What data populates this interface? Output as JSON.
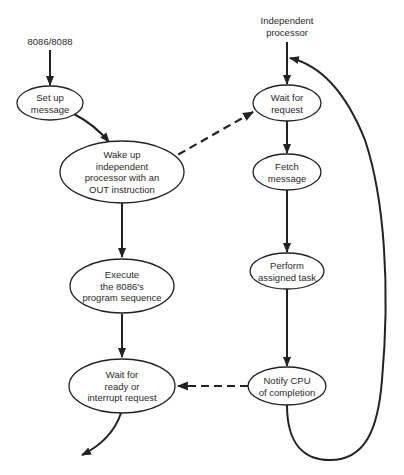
{
  "diagram": {
    "title_left": "8086/8088",
    "title_right": [
      "Independent",
      "processor"
    ],
    "cpu_nodes": [
      {
        "id": "setup",
        "lines": [
          "Set up",
          "message"
        ]
      },
      {
        "id": "wakeup",
        "lines": [
          "Wake up",
          "independent",
          "processor with an",
          "OUT instruction"
        ]
      },
      {
        "id": "execute",
        "lines": [
          "Execute",
          "the 8086's",
          "program sequence"
        ]
      },
      {
        "id": "waitready",
        "lines": [
          "Wait for",
          "ready or",
          "interrupt request"
        ]
      }
    ],
    "processor_nodes": [
      {
        "id": "waitrequest",
        "lines": [
          "Wait for",
          "request"
        ]
      },
      {
        "id": "fetch",
        "lines": [
          "Fetch",
          "message"
        ]
      },
      {
        "id": "perform",
        "lines": [
          "Perform",
          "assigned task"
        ]
      },
      {
        "id": "notify",
        "lines": [
          "Notify CPU",
          "of completion"
        ]
      }
    ],
    "edges": [
      {
        "from": "8086/8088",
        "to": "setup",
        "style": "solid"
      },
      {
        "from": "setup",
        "to": "wakeup",
        "style": "solid"
      },
      {
        "from": "wakeup",
        "to": "execute",
        "style": "solid"
      },
      {
        "from": "execute",
        "to": "waitready",
        "style": "solid"
      },
      {
        "from": "waitready",
        "to": "exit",
        "style": "solid"
      },
      {
        "from": "wakeup",
        "to": "waitrequest",
        "style": "dashed"
      },
      {
        "from": "Independent processor",
        "to": "waitrequest",
        "style": "solid"
      },
      {
        "from": "waitrequest",
        "to": "fetch",
        "style": "solid"
      },
      {
        "from": "fetch",
        "to": "perform",
        "style": "solid"
      },
      {
        "from": "perform",
        "to": "notify",
        "style": "solid"
      },
      {
        "from": "notify",
        "to": "waitready",
        "style": "dashed"
      },
      {
        "from": "notify",
        "to": "waitrequest",
        "style": "solid loop"
      }
    ],
    "line_color": "#222222"
  }
}
